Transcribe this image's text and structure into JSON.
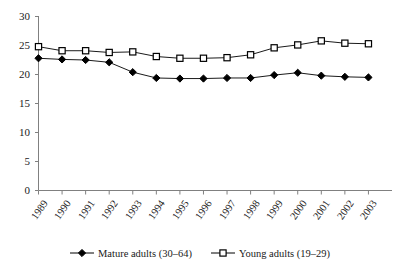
{
  "chart_data": {
    "type": "line",
    "title": "",
    "xlabel": "",
    "ylabel": "",
    "categories": [
      "1989",
      "1990",
      "1991",
      "1992",
      "1993",
      "1994",
      "1995",
      "1996",
      "1997",
      "1998",
      "1999",
      "2000",
      "2001",
      "2002",
      "2003"
    ],
    "ylim": [
      0,
      30
    ],
    "yticks": [
      0,
      5,
      10,
      15,
      20,
      25,
      30
    ],
    "grid": false,
    "legend_position": "bottom",
    "series": [
      {
        "name": "Mature adults (30–64)",
        "marker": "filled-diamond",
        "color": "#000000",
        "values": [
          22.8,
          22.6,
          22.5,
          22.1,
          20.4,
          19.4,
          19.3,
          19.3,
          19.4,
          19.4,
          19.9,
          20.3,
          19.8,
          19.6,
          19.5
        ]
      },
      {
        "name": "Young adults (19–29)",
        "marker": "open-square",
        "color": "#000000",
        "values": [
          24.8,
          24.1,
          24.1,
          23.8,
          23.9,
          23.1,
          22.8,
          22.8,
          22.9,
          23.4,
          24.6,
          25.1,
          25.8,
          25.4,
          25.3
        ]
      }
    ]
  },
  "axes": {
    "ytick_labels": [
      "30",
      "25",
      "20",
      "15",
      "10",
      "5",
      "0"
    ],
    "xtick_labels": [
      "1989",
      "1990",
      "1991",
      "1992",
      "1993",
      "1994",
      "1995",
      "1996",
      "1997",
      "1998",
      "1999",
      "2000",
      "2001",
      "2002",
      "2003"
    ]
  },
  "legend": {
    "entries": [
      {
        "label": "Mature adults (30–64)",
        "marker_name": "filled-diamond-marker"
      },
      {
        "label": "Young adults (19–29)",
        "marker_name": "open-square-marker"
      }
    ]
  },
  "colors": {
    "line": "#000000",
    "axis": "#808080",
    "text": "#1a1a1a",
    "background": "#ffffff"
  }
}
